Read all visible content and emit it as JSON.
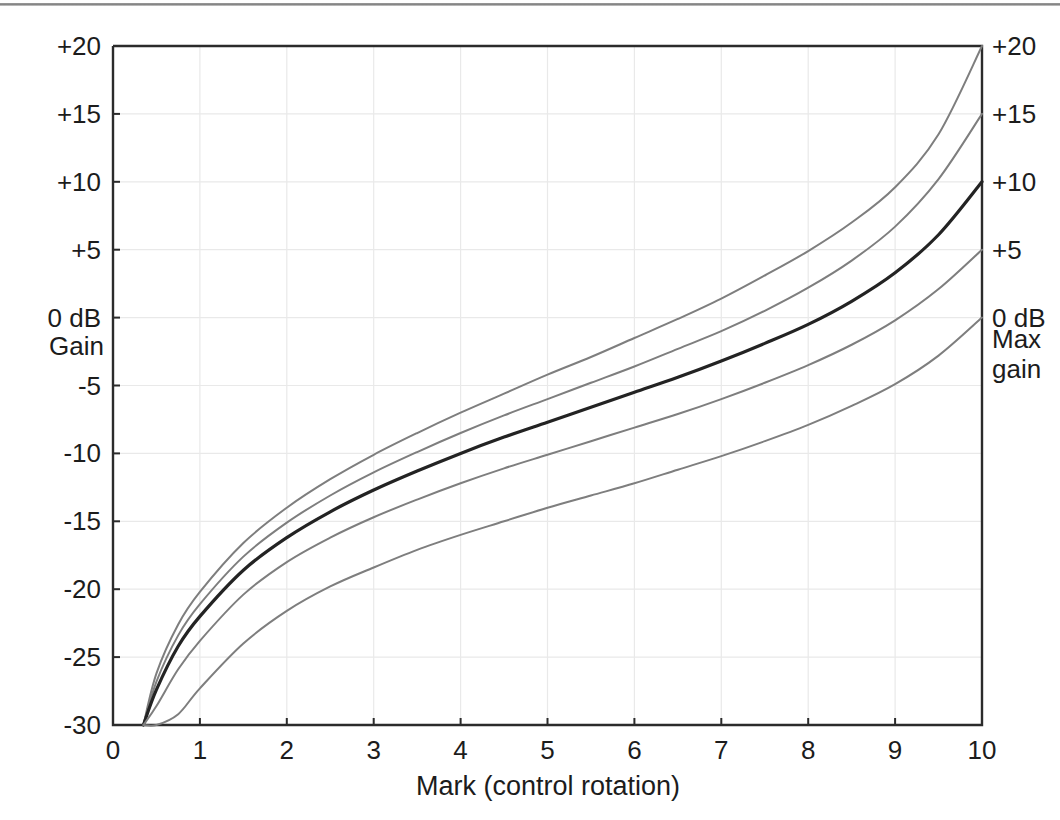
{
  "chart_data": {
    "type": "line",
    "title": "",
    "xlabel": "Mark  (control rotation)",
    "ylabel": "Gain",
    "xlim": [
      0,
      10
    ],
    "ylim": [
      -30,
      20
    ],
    "grid": true,
    "legend_position": "right-axis-labels",
    "x_ticks": [
      "0",
      "1",
      "2",
      "3",
      "4",
      "5",
      "6",
      "7",
      "8",
      "9",
      "10"
    ],
    "x_tick_values": [
      0,
      1,
      2,
      3,
      4,
      5,
      6,
      7,
      8,
      9,
      10
    ],
    "y_ticks": [
      "+20",
      "+15",
      "+10",
      "+5",
      "0 dB",
      "-5",
      "-10",
      "-15",
      "-20",
      "-25",
      "-30"
    ],
    "y_tick_values": [
      20,
      15,
      10,
      5,
      0,
      -5,
      -10,
      -15,
      -20,
      -25,
      -30
    ],
    "right_axis_labels": [
      "+20",
      "+15",
      "+10",
      "+5",
      "0 dB"
    ],
    "right_axis_values": [
      20,
      15,
      10,
      5,
      0
    ],
    "right_axis_caption_line1": "Max",
    "right_axis_caption_line2": "gain",
    "left_axis_caption": "Gain",
    "left_axis_zero_label": "0 dB",
    "x": [
      0.35,
      0.5,
      0.75,
      1.0,
      1.5,
      2.0,
      2.5,
      3.0,
      3.5,
      4.0,
      4.5,
      5.0,
      5.5,
      6.0,
      6.5,
      7.0,
      7.5,
      8.0,
      8.5,
      9.0,
      9.5,
      10.0
    ],
    "series": [
      {
        "name": "Max gain +20 dB",
        "end_label": "+20",
        "emphasis": "thin",
        "values": [
          -30.0,
          -26.2,
          -22.6,
          -20.2,
          -16.6,
          -14.0,
          -11.9,
          -10.1,
          -8.5,
          -7.0,
          -5.6,
          -4.2,
          -2.9,
          -1.5,
          -0.1,
          1.4,
          3.1,
          4.9,
          7.0,
          9.6,
          13.5,
          20.0
        ]
      },
      {
        "name": "Max gain +15 dB",
        "end_label": "+15",
        "emphasis": "thin",
        "values": [
          -30.0,
          -26.8,
          -23.4,
          -21.1,
          -17.6,
          -15.1,
          -13.1,
          -11.4,
          -9.9,
          -8.5,
          -7.2,
          -6.0,
          -4.8,
          -3.6,
          -2.3,
          -1.0,
          0.5,
          2.2,
          4.2,
          6.7,
          10.2,
          15.0
        ]
      },
      {
        "name": "Max gain +10 dB",
        "end_label": "+10",
        "emphasis": "bold",
        "values": [
          -30.0,
          -27.4,
          -24.2,
          -22.0,
          -18.6,
          -16.2,
          -14.3,
          -12.7,
          -11.3,
          -10.0,
          -8.8,
          -7.7,
          -6.6,
          -5.5,
          -4.4,
          -3.2,
          -1.9,
          -0.5,
          1.2,
          3.3,
          6.1,
          10.0
        ]
      },
      {
        "name": "Max gain +5 dB",
        "end_label": "+5",
        "emphasis": "thin",
        "values": [
          -30.0,
          -28.6,
          -25.9,
          -23.8,
          -20.4,
          -18.0,
          -16.2,
          -14.7,
          -13.4,
          -12.2,
          -11.1,
          -10.1,
          -9.1,
          -8.1,
          -7.1,
          -6.0,
          -4.8,
          -3.5,
          -2.0,
          -0.2,
          2.1,
          5.0
        ]
      },
      {
        "name": "Max gain 0 dB",
        "end_label": "0 dB",
        "emphasis": "thin",
        "values": [
          -30.0,
          -30.0,
          -29.2,
          -27.3,
          -24.0,
          -21.6,
          -19.8,
          -18.4,
          -17.1,
          -16.0,
          -15.0,
          -14.0,
          -13.1,
          -12.2,
          -11.2,
          -10.2,
          -9.1,
          -7.9,
          -6.5,
          -4.9,
          -2.8,
          0.0
        ]
      }
    ]
  },
  "plot_geometry": {
    "left_px": 113,
    "right_px": 982,
    "top_px": 46,
    "bottom_px": 725
  },
  "colors": {
    "axis": "#2b2b2b",
    "grid": "#e9e9e9",
    "curve_thin": "#7e7e7e",
    "curve_bold": "#232323",
    "background": "#ffffff"
  }
}
